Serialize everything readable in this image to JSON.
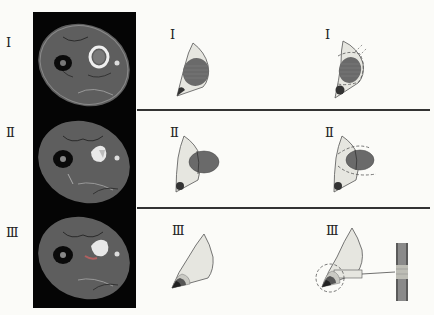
{
  "figure": {
    "type": "medical diagram",
    "colors": {
      "background": "#fbfbf8",
      "mri_background": "#050505",
      "mri_tissue": "#5b5b5b",
      "compartment_fill": "#e6e6e0",
      "lesion_fill": "#6a6a6a",
      "divider": "#333333",
      "dashed_margin": "#555555"
    }
  },
  "stages": [
    {
      "id": "I",
      "mri_label": "Ⅰ",
      "schematic_label": "Ⅰ",
      "resection_label": "Ⅰ",
      "description": "Lesion confined within the compartment"
    },
    {
      "id": "II",
      "mri_label": "Ⅱ",
      "schematic_label": "Ⅱ",
      "resection_label": "Ⅱ",
      "description": "Lesion extends beyond the compartment border"
    },
    {
      "id": "III",
      "mri_label": "Ⅲ",
      "schematic_label": "Ⅲ",
      "resection_label": "Ⅲ",
      "description": "Lesion involving the neurovascular bundle at the apex, with detail view of the vessel"
    }
  ]
}
